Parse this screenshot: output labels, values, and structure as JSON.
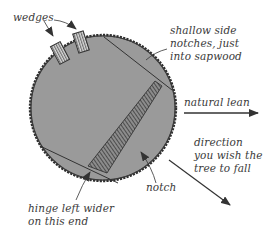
{
  "diagram": {
    "colors": {
      "trunk_fill": "#9a9a9a",
      "bark_outline": "#2e2e2e",
      "line": "#333333",
      "text": "#3a3a3a",
      "background": "#ffffff"
    },
    "labels": {
      "wedges": "wedges",
      "side_notches": [
        "shallow side",
        "notches, just",
        "into sapwood"
      ],
      "natural_lean": "natural lean",
      "fall_direction": [
        "direction",
        "you wish the",
        "tree to fall"
      ],
      "notch": "notch",
      "hinge": [
        "hinge left wider",
        "on this end"
      ]
    },
    "elements": [
      {
        "id": "trunk",
        "shape": "circle",
        "description": "cross-section of tree trunk with rough bark edge"
      },
      {
        "id": "wedge-1",
        "shape": "rectangle",
        "pattern": "vertical stripes"
      },
      {
        "id": "wedge-2",
        "shape": "rectangle",
        "pattern": "vertical stripes"
      },
      {
        "id": "hinge",
        "shape": "tapered band",
        "pattern": "diagonal hatching"
      },
      {
        "id": "back-cut-line",
        "shape": "line"
      },
      {
        "id": "notch-line",
        "shape": "line"
      },
      {
        "id": "natural-lean-arrow",
        "shape": "arrow",
        "direction": "right"
      },
      {
        "id": "fall-direction-arrow",
        "shape": "arrow",
        "direction": "down-right"
      }
    ]
  }
}
